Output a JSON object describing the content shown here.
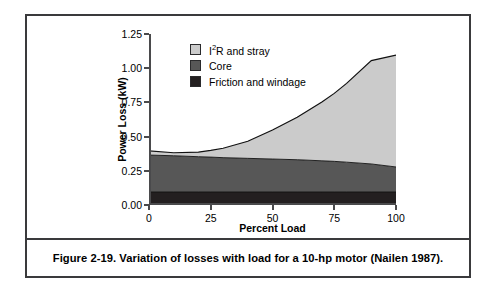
{
  "figure": {
    "caption": "Figure 2-19.  Variation of losses with load for a 10-hp motor (Nailen 1987)."
  },
  "chart_data": {
    "type": "area",
    "title": "",
    "subtitle": "",
    "xlabel": "Percent Load",
    "ylabel": "Power Loss (kW)",
    "xlim": [
      0,
      100
    ],
    "ylim": [
      0,
      1.25
    ],
    "xticks": [
      "0",
      "25",
      "50",
      "75",
      "100"
    ],
    "xtick_values": [
      0,
      25,
      50,
      75,
      100
    ],
    "yticks": [
      "0.00",
      "0.25",
      "0.50",
      "0.75",
      "1.00",
      "1.25"
    ],
    "ytick_values": [
      0.0,
      0.25,
      0.5,
      0.75,
      1.0,
      1.25
    ],
    "grid": false,
    "stacked": true,
    "legend_position": "top-left",
    "x": [
      0,
      10,
      20,
      25,
      30,
      40,
      50,
      60,
      70,
      75,
      80,
      90,
      100
    ],
    "series": [
      {
        "name": "Friction and windage",
        "color": "#231f20",
        "values": [
          0.095,
          0.095,
          0.095,
          0.095,
          0.095,
          0.095,
          0.095,
          0.095,
          0.095,
          0.095,
          0.095,
          0.095,
          0.095
        ]
      },
      {
        "name": "Core",
        "color": "#575757",
        "values": [
          0.27,
          0.265,
          0.258,
          0.255,
          0.251,
          0.246,
          0.241,
          0.236,
          0.228,
          0.224,
          0.218,
          0.205,
          0.183
        ]
      },
      {
        "name": "I2R and stray",
        "color": "#cbcbcb",
        "values": [
          0.03,
          0.022,
          0.034,
          0.049,
          0.069,
          0.125,
          0.212,
          0.311,
          0.43,
          0.497,
          0.576,
          0.756,
          0.818
        ]
      }
    ],
    "cumulative_tops": {
      "friction_and_windage": [
        0.095,
        0.095,
        0.095,
        0.095,
        0.095,
        0.095,
        0.095,
        0.095,
        0.095,
        0.095,
        0.095,
        0.095,
        0.095
      ],
      "core": [
        0.365,
        0.36,
        0.353,
        0.35,
        0.346,
        0.341,
        0.336,
        0.331,
        0.323,
        0.319,
        0.313,
        0.3,
        0.278
      ],
      "total": [
        0.395,
        0.382,
        0.387,
        0.399,
        0.415,
        0.466,
        0.548,
        0.642,
        0.753,
        0.816,
        0.889,
        1.056,
        1.096
      ]
    },
    "legend": [
      {
        "label_html": "I<sup>2</sup>R and stray",
        "label": "I2R and stray",
        "color": "#cbcbcb"
      },
      {
        "label_html": "Core",
        "label": "Core",
        "color": "#575757"
      },
      {
        "label_html": "Friction and windage",
        "label": "Friction and windage",
        "color": "#231f20"
      }
    ]
  },
  "colors": {
    "frame": "#3a3a3c",
    "axis": "#4a4a4c",
    "band_light": "#cbcbcb",
    "band_medium": "#575757",
    "band_dark": "#231f20",
    "outline": "#111111",
    "background": "#ffffff"
  }
}
